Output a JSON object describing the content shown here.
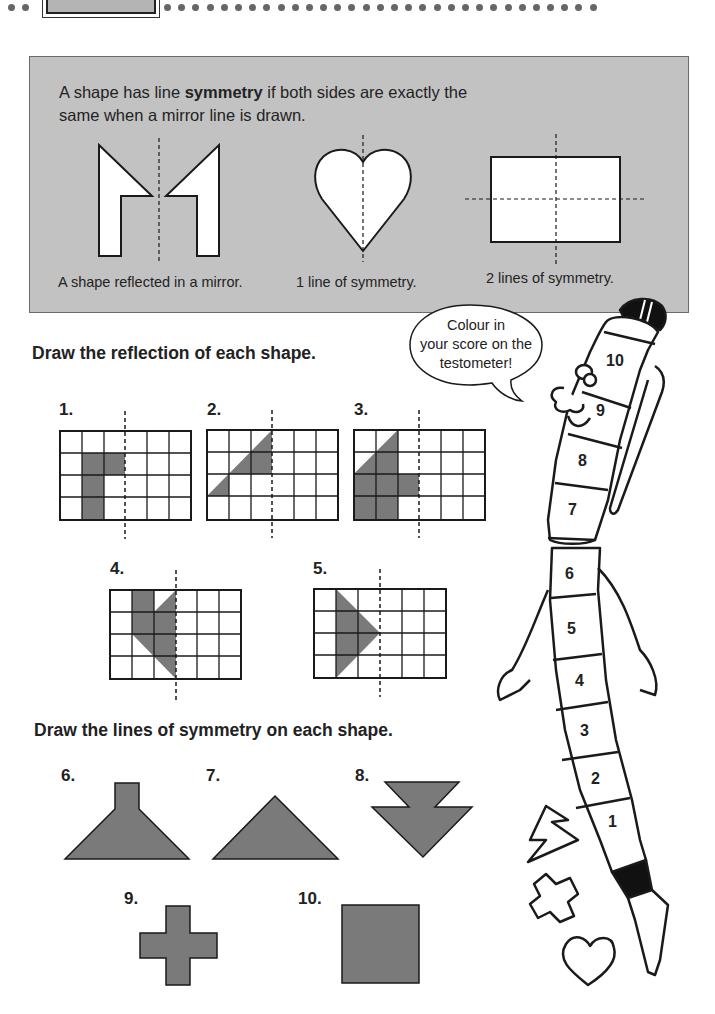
{
  "header": {
    "dots_left": 2,
    "dots_right": 31
  },
  "info_box": {
    "intro_before": "A shape has line ",
    "intro_bold": "symmetry",
    "intro_after": " if both sides are exactly the same when a mirror line is drawn.",
    "examples": [
      {
        "caption": "A shape reflected in a mirror.",
        "shape": "arrow-pair"
      },
      {
        "caption": "1 line of symmetry.",
        "shape": "heart"
      },
      {
        "caption": "2 lines of symmetry.",
        "shape": "rectangle"
      }
    ],
    "background": "#c2c2c2"
  },
  "section1": {
    "heading": "Draw the reflection of each shape.",
    "questions": [
      {
        "number": "1.",
        "grid": "6x4",
        "mirror_col": 3
      },
      {
        "number": "2.",
        "grid": "6x4",
        "mirror_col": 3
      },
      {
        "number": "3.",
        "grid": "6x4",
        "mirror_col": 3
      },
      {
        "number": "4.",
        "grid": "6x4",
        "mirror_col": 3
      },
      {
        "number": "5.",
        "grid": "6x4",
        "mirror_col": 3
      }
    ]
  },
  "section2": {
    "heading": "Draw the lines of symmetry on each shape.",
    "questions": [
      {
        "number": "6.",
        "shape": "trapezoid-with-chimney"
      },
      {
        "number": "7.",
        "shape": "triangle"
      },
      {
        "number": "8.",
        "shape": "double-arrow-down"
      },
      {
        "number": "9.",
        "shape": "plus-cross"
      },
      {
        "number": "10.",
        "shape": "square"
      }
    ]
  },
  "testometer": {
    "speech": [
      "Colour in",
      "your score on the",
      "testometer!"
    ],
    "scores": [
      "10",
      "9",
      "8",
      "7",
      "6",
      "5",
      "4",
      "3",
      "2",
      "1"
    ]
  },
  "colors": {
    "shape_fill": "#7a7a7a",
    "ink": "#1a1a1a",
    "panel": "#c2c2c2"
  }
}
